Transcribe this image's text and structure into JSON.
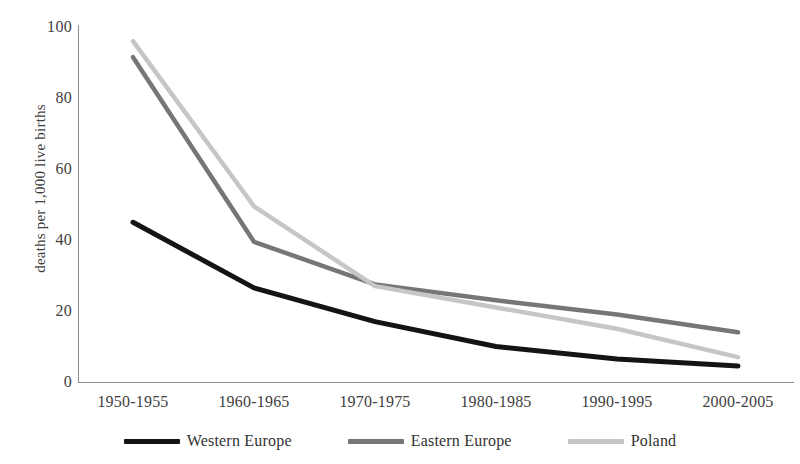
{
  "chart_data": {
    "type": "line",
    "title": "",
    "xlabel": "",
    "ylabel": "deaths per 1,000 live births",
    "categories": [
      "1950-1955",
      "1960-1965",
      "1970-1975",
      "1980-1985",
      "1990-1995",
      "2000-2005"
    ],
    "ylim": [
      0,
      100
    ],
    "yticks": [
      0,
      20,
      40,
      60,
      80,
      100
    ],
    "grid": false,
    "legend_position": "bottom",
    "series": [
      {
        "name": "Western Europe",
        "color": "#141414",
        "values": [
          45,
          26.5,
          17,
          10,
          6.5,
          4.5
        ]
      },
      {
        "name": "Eastern Europe",
        "color": "#767676",
        "values": [
          91.5,
          39.5,
          27.5,
          23,
          19,
          14
        ]
      },
      {
        "name": "Poland",
        "color": "#c6c6c6",
        "values": [
          96,
          49.5,
          27,
          21,
          15,
          7
        ]
      }
    ]
  },
  "legend": {
    "items": [
      {
        "label": "Western Europe",
        "color": "#141414"
      },
      {
        "label": "Eastern Europe",
        "color": "#767676"
      },
      {
        "label": "Poland",
        "color": "#c6c6c6"
      }
    ]
  },
  "axis_colors": {
    "line": "#8d8d8d",
    "text": "#404040"
  }
}
